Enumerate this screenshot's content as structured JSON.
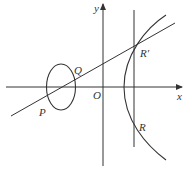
{
  "figure": {
    "type": "coordinate-geometry",
    "axes": {
      "x_label": "x",
      "y_label": "y",
      "origin_label": "O"
    },
    "points": {
      "P": "P",
      "Q": "Q",
      "R_prime": "R′",
      "R": "R"
    },
    "curves": [
      "ellipse",
      "hyperbola-right-branch",
      "secant-line",
      "vertical-line"
    ],
    "colors": {
      "stroke": "#333333",
      "background": "#ffffff"
    }
  }
}
